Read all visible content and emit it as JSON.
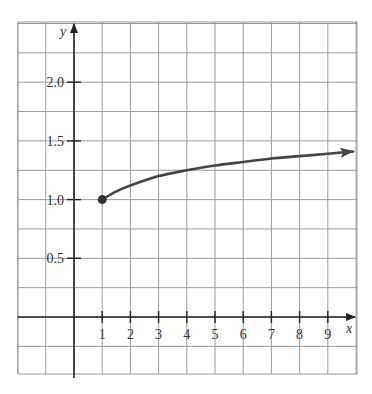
{
  "chart_data": {
    "type": "line",
    "title": "",
    "xlabel": "x",
    "ylabel": "y",
    "xlim": [
      -2,
      10
    ],
    "ylim": [
      -0.2,
      2.4
    ],
    "grid": true,
    "x_ticks": [
      1,
      2,
      3,
      4,
      5,
      6,
      7,
      8,
      9
    ],
    "x_tick_labels": [
      "1",
      "2",
      "3",
      "4",
      "5",
      "6",
      "7",
      "8",
      "9"
    ],
    "y_ticks": [
      0.5,
      1.0,
      1.5,
      2.0
    ],
    "y_tick_labels": [
      "0.5",
      "1.0",
      "1.5",
      "2.0"
    ],
    "series": [
      {
        "name": "curve",
        "color": "#444444",
        "start_point": {
          "x": 1,
          "y": 1.0,
          "marker": "filled-dot"
        },
        "end": "arrow",
        "x": [
          1,
          1.5,
          2,
          3,
          4,
          5,
          6,
          7,
          8,
          9,
          9.9
        ],
        "y": [
          1.0,
          1.07,
          1.12,
          1.2,
          1.25,
          1.29,
          1.32,
          1.35,
          1.37,
          1.39,
          1.41
        ]
      }
    ]
  }
}
